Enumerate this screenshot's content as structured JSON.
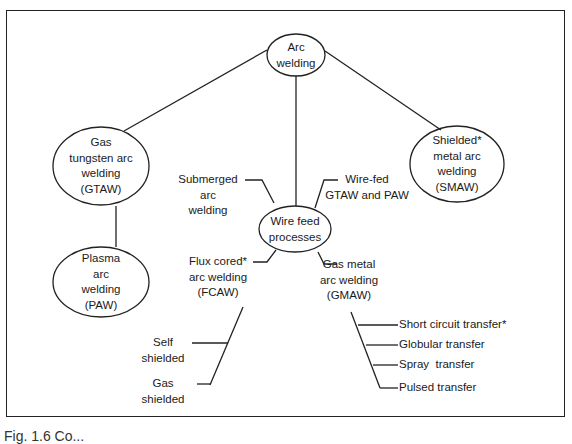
{
  "diagram": {
    "title_node": "Arc welding",
    "nodes": {
      "arc_welding": [
        "Arc",
        "welding"
      ],
      "gtaw": [
        "Gas",
        "tungsten arc",
        "welding",
        "(GTAW)"
      ],
      "paw": [
        "Plasma",
        "arc",
        "welding",
        "(PAW)"
      ],
      "wire_feed": [
        "Wire feed",
        "processes"
      ],
      "smaw": [
        "Shielded*",
        "metal arc",
        "welding",
        "(SMAW)"
      ]
    },
    "labels": {
      "submerged": [
        "Submerged",
        "arc",
        "welding"
      ],
      "wire_fed": [
        "Wire-fed",
        "GTAW and PAW"
      ],
      "fcaw": [
        "Flux cored*",
        "arc welding",
        "(FCAW)"
      ],
      "gmaw": [
        "Gas metal",
        "arc welding",
        "(GMAW)"
      ],
      "self_shielded": [
        "Self",
        "shielded"
      ],
      "gas_shielded": [
        "Gas",
        "shielded"
      ],
      "short_circuit": "Short circuit transfer*",
      "globular": "Globular transfer",
      "spray": "Spray  transfer",
      "pulsed": "Pulsed transfer"
    },
    "edges": [
      [
        "Arc welding",
        "Gas tungsten arc welding (GTAW)"
      ],
      [
        "Arc welding",
        "Wire feed processes"
      ],
      [
        "Arc welding",
        "Shielded metal arc welding (SMAW)"
      ],
      [
        "Gas tungsten arc welding (GTAW)",
        "Plasma arc welding (PAW)"
      ],
      [
        "Wire feed processes",
        "Submerged arc welding"
      ],
      [
        "Wire feed processes",
        "Wire-fed GTAW and PAW"
      ],
      [
        "Wire feed processes",
        "Flux cored arc welding (FCAW)"
      ],
      [
        "Wire feed processes",
        "Gas metal arc welding (GMAW)"
      ],
      [
        "Flux cored arc welding (FCAW)",
        "Self shielded"
      ],
      [
        "Flux cored arc welding (FCAW)",
        "Gas shielded"
      ],
      [
        "Gas metal arc welding (GMAW)",
        "Short circuit transfer"
      ],
      [
        "Gas metal arc welding (GMAW)",
        "Globular transfer"
      ],
      [
        "Gas metal arc welding (GMAW)",
        "Spray transfer"
      ],
      [
        "Gas metal arc welding (GMAW)",
        "Pulsed transfer"
      ]
    ]
  },
  "caption": "Fig. 1.6  Co..."
}
